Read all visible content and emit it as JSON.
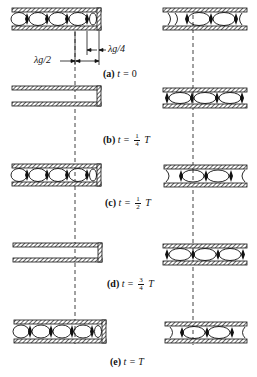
{
  "figure": {
    "dimensions": {
      "half_wavelength_label": "λg/2",
      "quarter_wavelength_label": "λg/4"
    },
    "panels": [
      {
        "id": "a",
        "tag": "(a)",
        "time_prefix": "t =",
        "time_value": "0",
        "fraction": null,
        "suffix": ""
      },
      {
        "id": "b",
        "tag": "(b)",
        "time_prefix": "t =",
        "time_value": "",
        "fraction": {
          "num": "1",
          "den": "4"
        },
        "suffix": "T"
      },
      {
        "id": "c",
        "tag": "(c)",
        "time_prefix": "t =",
        "time_value": "",
        "fraction": {
          "num": "1",
          "den": "2"
        },
        "suffix": "T"
      },
      {
        "id": "d",
        "tag": "(d)",
        "time_prefix": "t =",
        "time_value": "",
        "fraction": {
          "num": "3",
          "den": "4"
        },
        "suffix": "T"
      },
      {
        "id": "e",
        "tag": "(e)",
        "time_prefix": "t =",
        "time_value": "T",
        "fraction": null,
        "suffix": ""
      }
    ],
    "colors": {
      "line": "#111111",
      "background": "#ffffff"
    }
  }
}
